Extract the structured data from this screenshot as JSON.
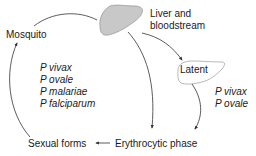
{
  "diagram": {
    "title": "",
    "nodes": {
      "mosquito": {
        "label": "Mosquito"
      },
      "liver": {
        "label_line1": "Liver and",
        "label_line2": "bloodstream",
        "icon": "liver-icon"
      },
      "latent": {
        "label": "Latent",
        "icon": "liver-outline-icon"
      },
      "erythrocytic": {
        "label": "Erythrocytic phase"
      },
      "sexual": {
        "label": "Sexual forms"
      }
    },
    "species_all": [
      "P vivax",
      "P ovale",
      "P malariae",
      "P falciparum"
    ],
    "species_latent": [
      "P vivax",
      "P ovale"
    ],
    "edges": [
      {
        "from": "mosquito",
        "to": "liver"
      },
      {
        "from": "liver",
        "to": "latent"
      },
      {
        "from": "liver",
        "to": "erythrocytic"
      },
      {
        "from": "latent",
        "to": "erythrocytic"
      },
      {
        "from": "erythrocytic",
        "to": "sexual"
      },
      {
        "from": "sexual",
        "to": "mosquito"
      }
    ],
    "colors": {
      "liver_fill": "#c8c8c8",
      "liver_stroke": "#9a9a9a",
      "latent_fill": "#ffffff",
      "arrow": "#333333",
      "text": "#1a1a1a"
    }
  }
}
